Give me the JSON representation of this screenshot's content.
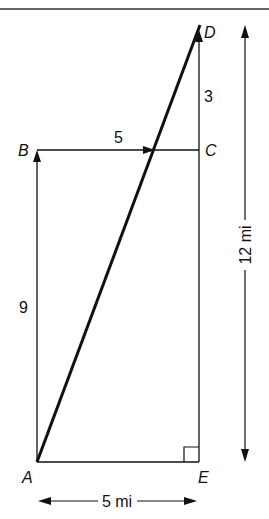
{
  "diagram": {
    "type": "geometry-displacement",
    "points": {
      "A": "A",
      "B": "B",
      "C": "C",
      "D": "D",
      "E": "E"
    },
    "segment_labels": {
      "AB": "9",
      "BC": "5",
      "CD": "3"
    },
    "dimension_labels": {
      "width": "5 mi",
      "height": "12 mi"
    },
    "right_angle_at": "E",
    "colors": {
      "ink": "#111111",
      "background": "#ffffff"
    }
  }
}
